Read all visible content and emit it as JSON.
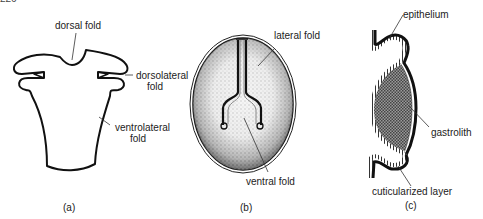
{
  "page_number_fragment": "226",
  "panels": [
    {
      "id": "a",
      "caption": "(a)",
      "labels": {
        "dorsal_fold": "dorsal fold",
        "dorsolateral_fold_1": "dorsolateral",
        "dorsolateral_fold_2": "fold",
        "ventrolateral_fold_1": "ventrolateral",
        "ventrolateral_fold_2": "fold"
      }
    },
    {
      "id": "b",
      "caption": "(b)",
      "labels": {
        "lateral_fold": "lateral fold",
        "ventral_fold": "ventral fold"
      }
    },
    {
      "id": "c",
      "caption": "(c)",
      "labels": {
        "epithelium": "epithelium",
        "gastrolith": "gastrolith",
        "cuticularized_layer": "cuticularized layer"
      }
    }
  ]
}
